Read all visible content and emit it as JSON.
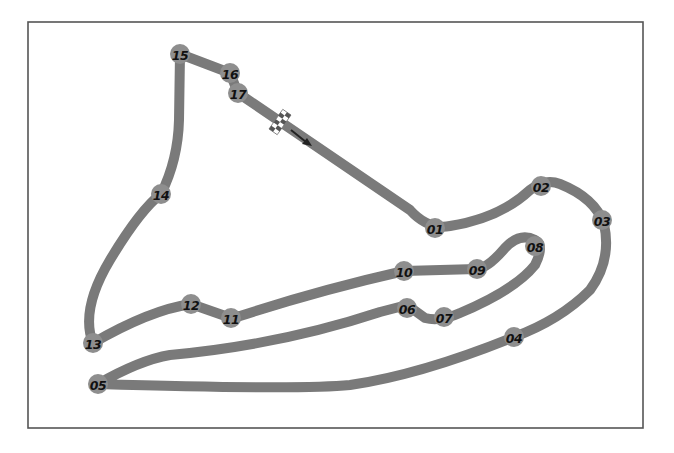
{
  "map": {
    "type": "race-circuit-layout",
    "colors": {
      "track": "#7a7a7a",
      "marker": "#8e8e8e",
      "label": "#111111",
      "frame": "#555555",
      "background": "#ffffff"
    },
    "frame": {
      "x": 28,
      "y": 22,
      "width": 615,
      "height": 406
    },
    "start_finish": {
      "icon": "checkered-flag-icon",
      "x": 280,
      "y": 122,
      "direction": "south-east"
    },
    "direction_arrow": {
      "icon": "arrow-right-down-icon",
      "from": [
        291,
        130
      ],
      "to": [
        311,
        145
      ]
    },
    "corners": [
      {
        "id": "01",
        "label": "01",
        "x": 435,
        "y": 228
      },
      {
        "id": "02",
        "label": "02",
        "x": 541,
        "y": 186
      },
      {
        "id": "03",
        "label": "03",
        "x": 602,
        "y": 220
      },
      {
        "id": "04",
        "label": "04",
        "x": 514,
        "y": 337
      },
      {
        "id": "05",
        "label": "05",
        "x": 98,
        "y": 384
      },
      {
        "id": "06",
        "label": "06",
        "x": 407,
        "y": 308
      },
      {
        "id": "07",
        "label": "07",
        "x": 444,
        "y": 317
      },
      {
        "id": "08",
        "label": "08",
        "x": 535,
        "y": 246
      },
      {
        "id": "09",
        "label": "09",
        "x": 477,
        "y": 269
      },
      {
        "id": "10",
        "label": "10",
        "x": 404,
        "y": 271
      },
      {
        "id": "11",
        "label": "11",
        "x": 231,
        "y": 318
      },
      {
        "id": "12",
        "label": "12",
        "x": 191,
        "y": 304
      },
      {
        "id": "13",
        "label": "13",
        "x": 93,
        "y": 343
      },
      {
        "id": "14",
        "label": "14",
        "x": 161,
        "y": 194
      },
      {
        "id": "15",
        "label": "15",
        "x": 180,
        "y": 54
      },
      {
        "id": "16",
        "label": "16",
        "x": 230,
        "y": 73
      },
      {
        "id": "17",
        "label": "17",
        "x": 238,
        "y": 93
      }
    ]
  }
}
